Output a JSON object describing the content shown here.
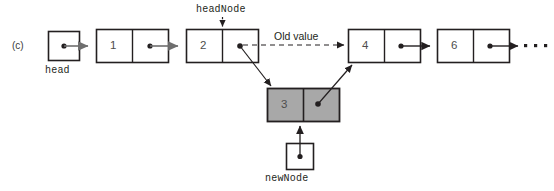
{
  "figure": {
    "panel_label": "(c)",
    "type": "linked-list-insertion-diagram",
    "background": "#ffffff",
    "stroke": "#231f20",
    "node_fill": "#ffffff",
    "new_node_fill": "#a8a8a8",
    "arrow_gray": "#6e6e6e"
  },
  "labels": {
    "head": "head",
    "head_node": "headNode",
    "new_node": "newNode",
    "old_value": "Old value",
    "ellipsis": "• • •"
  },
  "pointers": [
    {
      "name": "head",
      "label": "head",
      "value_dot": true
    },
    {
      "name": "newNode",
      "label": "newNode",
      "value_dot": true
    }
  ],
  "nodes": [
    {
      "id": "node-1",
      "value": "1",
      "shaded": false,
      "next_dot": true
    },
    {
      "id": "node-2",
      "value": "2",
      "shaded": false,
      "next_dot": true
    },
    {
      "id": "node-3-new",
      "value": "3",
      "shaded": true,
      "next_dot": true
    },
    {
      "id": "node-4",
      "value": "4",
      "shaded": false,
      "next_dot": true
    },
    {
      "id": "node-6",
      "value": "6",
      "shaded": false,
      "next_dot": true
    }
  ],
  "links": [
    {
      "from": "head",
      "to": "node-1",
      "style": "solid-gray"
    },
    {
      "from": "node-1",
      "to": "node-2",
      "style": "solid-gray"
    },
    {
      "from": "node-2",
      "to": "node-4",
      "style": "dashed",
      "annotation": "Old value"
    },
    {
      "from": "node-2",
      "to": "node-3-new",
      "style": "solid-diagonal"
    },
    {
      "from": "node-3-new",
      "to": "node-4",
      "style": "solid-diagonal"
    },
    {
      "from": "node-4",
      "to": "node-6",
      "style": "solid"
    },
    {
      "from": "node-6",
      "to": "ellipsis",
      "style": "solid"
    },
    {
      "from": "newNode",
      "to": "node-3-new",
      "style": "solid-vertical"
    },
    {
      "from": "headNode",
      "to": "node-2",
      "style": "short-vertical"
    }
  ]
}
